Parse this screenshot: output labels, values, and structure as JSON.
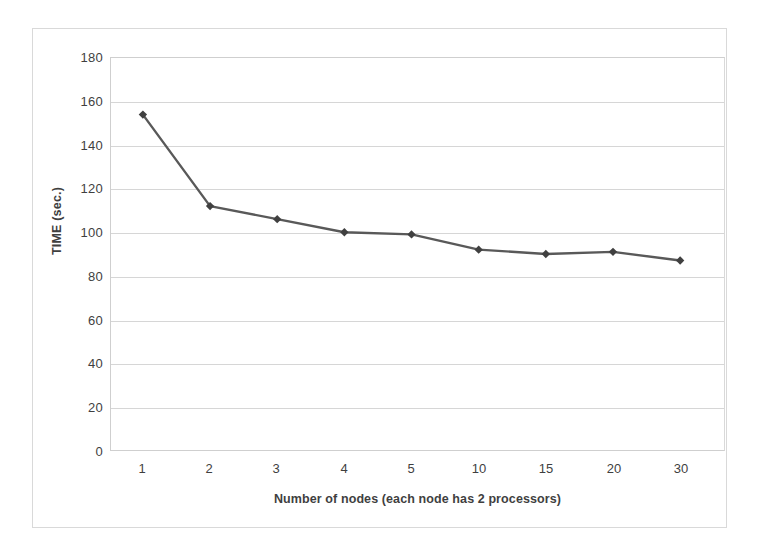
{
  "chart_data": {
    "type": "line",
    "title": "",
    "xlabel": "Number of nodes (each node has 2 processors)",
    "ylabel": "TIME (sec.)",
    "categories": [
      "1",
      "2",
      "3",
      "4",
      "5",
      "10",
      "15",
      "20",
      "30"
    ],
    "values": [
      154,
      112,
      106,
      100,
      99,
      92,
      90,
      91,
      87
    ],
    "series": [
      {
        "name": "TIME (sec.)",
        "values": [
          154,
          112,
          106,
          100,
          99,
          92,
          90,
          91,
          87
        ]
      }
    ],
    "ylim": [
      0,
      180
    ],
    "yticks": [
      0,
      20,
      40,
      60,
      80,
      100,
      120,
      140,
      160,
      180
    ],
    "ytick_labels": [
      "0",
      "20",
      "40",
      "60",
      "80",
      "100",
      "120",
      "140",
      "160",
      "180"
    ],
    "grid": true,
    "legend": "none",
    "marker": "diamond",
    "line_color": "#595959",
    "marker_color": "#404040",
    "gridline_color": "#d6d6d6",
    "plot_border_color": "#cfcfcf",
    "figure_border_color": "#d9d9d9",
    "background_color": "#ffffff",
    "text_color": "#3f3f3f"
  }
}
